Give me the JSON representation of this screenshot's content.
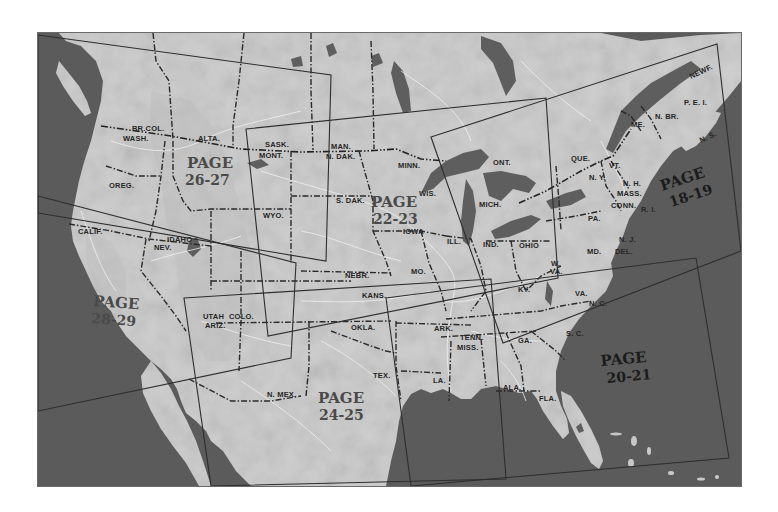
{
  "map": {
    "title": "Regional map index of the United States",
    "colors": {
      "ocean": "#5b5b5b",
      "land": "#cfcfcf",
      "lakes": "#5e5e5e",
      "borders": "#2a2a2a",
      "page_outlines": "#2e2e2e",
      "rivers": "#f2f2f2"
    },
    "page_regions": [
      {
        "id": "18-19",
        "word": "PAGE",
        "number": "18-19",
        "region": "Northeast"
      },
      {
        "id": "20-21",
        "word": "PAGE",
        "number": "20-21",
        "region": "Southeast"
      },
      {
        "id": "22-23",
        "word": "PAGE",
        "number": "22-23",
        "region": "Midwest"
      },
      {
        "id": "24-25",
        "word": "PAGE",
        "number": "24-25",
        "region": "Southwest"
      },
      {
        "id": "26-27",
        "word": "PAGE",
        "number": "26-27",
        "region": "Northwest"
      },
      {
        "id": "28-29",
        "word": "PAGE",
        "number": "28-29",
        "region": "West Coast"
      }
    ],
    "labels": {
      "brcol": "BR.COL.",
      "wash": "WASH.",
      "alta": "ALTA.",
      "sask": "SASK.",
      "mont": "MONT.",
      "man": "MAN.",
      "ndak": "N. DAK.",
      "oreg": "OREG.",
      "wyo": "WYO.",
      "sdak": "S. DAK.",
      "minn": "MINN.",
      "ont": "ONT.",
      "que": "QUE.",
      "wis": "WIS.",
      "mich": "MICH.",
      "iowa": "IOWA",
      "ill": "ILL.",
      "ind": "IND.",
      "ohio": "OHIO",
      "calif": "CALIF.",
      "idaho": "IDAHO",
      "nev": "NEV.",
      "nebr": "NEBR.",
      "mo": "MO.",
      "kans": "KANS.",
      "ky": "KY.",
      "wva": "W.",
      "wva2": "VA.",
      "va": "VA.",
      "nc": "N. C.",
      "sc": "S. C.",
      "utah": "UTAH",
      "colo": "COLO.",
      "ariz": "ARIZ.",
      "okla": "OKLA.",
      "ark": "ARK.",
      "tenn": "TENN.",
      "miss": "MISS.",
      "ga": "GA.",
      "tex": "TEX.",
      "la": "LA.",
      "ala": "ALA.",
      "fla": "FLA.",
      "nmex": "N. MEX.",
      "ny": "N. Y.",
      "vt": "VT.",
      "nh": "N. H.",
      "mass": "MASS.",
      "conn": "CONN.",
      "ri": "R. I.",
      "pa": "PA.",
      "nj": "N. J.",
      "md": "MD.",
      "del": "DEL.",
      "me": "ME.",
      "nbr": "N. BR.",
      "pei": "P. E. I.",
      "ns": "N. S.",
      "newf": "NEWF."
    }
  }
}
